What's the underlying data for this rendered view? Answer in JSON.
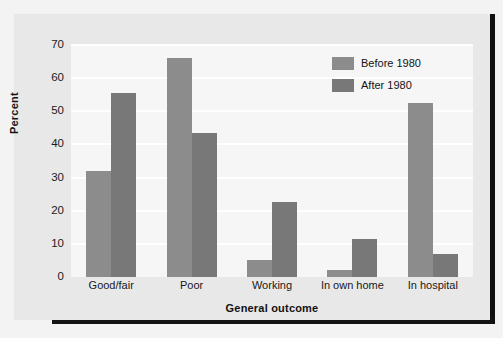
{
  "chart_data": {
    "type": "bar",
    "title": "",
    "xlabel": "General outcome",
    "ylabel": "Percent",
    "categories": [
      "Good/fair",
      "Poor",
      "Working",
      "In own home",
      "In hospital"
    ],
    "series": [
      {
        "name": "Before 1980",
        "color": "#8c8c8c",
        "values": [
          32,
          66,
          5,
          2,
          52.5
        ]
      },
      {
        "name": "After 1980",
        "color": "#787878",
        "values": [
          55.5,
          43.5,
          22.5,
          11.5,
          7
        ]
      }
    ],
    "ylim": [
      0,
      70
    ],
    "yticks": [
      0,
      10,
      20,
      30,
      40,
      50,
      60,
      70
    ],
    "ytick_labels": [
      "0",
      "10",
      "20",
      "30",
      "40",
      "50",
      "60",
      "70"
    ],
    "grid": true,
    "grid_color": "#ffffff",
    "legend_position": "top-right",
    "plot_background": "#f6f6f6",
    "card_background": "#e8e8e8"
  }
}
